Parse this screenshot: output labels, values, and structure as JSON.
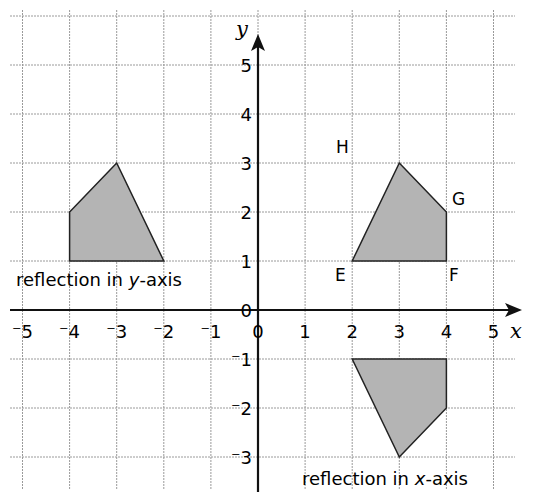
{
  "axes": {
    "x_label": "x",
    "y_label": "y",
    "x_ticks": [
      "-5",
      "-4",
      "-3",
      "-2",
      "-1",
      "0",
      "1",
      "2",
      "3",
      "4",
      "5"
    ],
    "y_ticks": [
      "5",
      "4",
      "3",
      "2",
      "1",
      "0",
      "-1",
      "-2",
      "-3"
    ],
    "xlim": [
      -5,
      5
    ],
    "ylim": [
      -3,
      5
    ]
  },
  "shapes": [
    {
      "name": "EFGH",
      "points": [
        [
          2,
          1
        ],
        [
          4,
          1
        ],
        [
          4,
          2
        ],
        [
          3,
          3
        ]
      ],
      "vertex_labels": [
        "E",
        "F",
        "G",
        "H"
      ]
    },
    {
      "name": "reflection in y-axis",
      "points": [
        [
          -2,
          1
        ],
        [
          -4,
          1
        ],
        [
          -4,
          2
        ],
        [
          -3,
          3
        ]
      ],
      "label": "reflection in y-axis"
    },
    {
      "name": "reflection in x-axis",
      "points": [
        [
          2,
          -1
        ],
        [
          4,
          -1
        ],
        [
          4,
          -2
        ],
        [
          3,
          -3
        ]
      ],
      "label": "reflection in x-axis"
    }
  ],
  "labels": {
    "reflect_y": {
      "pre": "reflection in ",
      "var": "y",
      "post": "-axis"
    },
    "reflect_x": {
      "pre": "reflection in ",
      "var": "x",
      "post": "-axis"
    }
  },
  "colors": {
    "fill": "#b4b4b4",
    "stroke": "#222222",
    "grid": "#9a9a9a",
    "axis": "#111111"
  }
}
